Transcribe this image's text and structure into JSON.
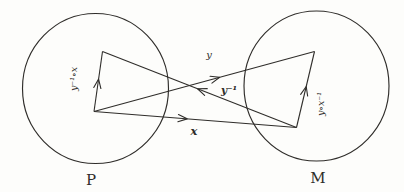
{
  "figure": {
    "background": "#fdfdfb",
    "ink": "#2f2d2a",
    "sets": [
      {
        "id": "P",
        "label": "P",
        "cx": 95.5,
        "cy": 88.5,
        "rx": 73,
        "ry": 75,
        "label_x": 91,
        "label_y": 185,
        "label_size": 15
      },
      {
        "id": "M",
        "label": "M",
        "cx": 316.5,
        "cy": 86,
        "rx": 72.5,
        "ry": 75,
        "label_x": 318,
        "label_y": 183,
        "label_size": 15
      }
    ],
    "anchors": {
      "p_bottom": {
        "x": 94,
        "y": 111.5
      },
      "p_top": {
        "x": 102.5,
        "y": 51.5
      },
      "m_top": {
        "x": 314.5,
        "y": 51.5
      },
      "m_bottom": {
        "x": 296.5,
        "y": 127.5
      }
    },
    "arrows": [
      {
        "id": "map-x",
        "label": "x",
        "from": "p_bottom",
        "to": "m_bottom",
        "head_t": 0.46,
        "label_x": 194,
        "label_y": 135,
        "label_rotate": 0,
        "bold": true,
        "font_size": 11.5
      },
      {
        "id": "map-y",
        "label": "y",
        "from": "p_bottom",
        "to": "m_top",
        "head_t": 0.57,
        "label_x": 209,
        "label_y": 58,
        "label_rotate": 0,
        "bold": false,
        "font_size": 10
      },
      {
        "id": "map-y-inverse",
        "label": "y⁻¹",
        "from": "m_bottom",
        "to": "p_top",
        "head_t": 0.51,
        "label_x": 229,
        "label_y": 94,
        "label_rotate": 0,
        "bold": true,
        "font_size": 10.5
      },
      {
        "id": "map-y-inverse-after-x",
        "label": "y⁻¹∘x",
        "from": "p_bottom",
        "to": "p_top",
        "head_t": 0.54,
        "label_x": 77,
        "label_y": 79,
        "label_rotate": -90,
        "bold": false,
        "font_size": 9.5
      },
      {
        "id": "map-y-after-x-inverse",
        "label": "y∘x⁻¹",
        "from": "m_bottom",
        "to": "m_top",
        "head_t": 0.54,
        "label_x": 324,
        "label_y": 104,
        "label_rotate": -90,
        "bold": false,
        "font_size": 9.5
      }
    ]
  }
}
